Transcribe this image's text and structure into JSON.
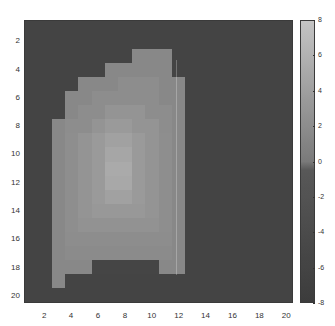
{
  "chart_data": {
    "type": "heatmap",
    "title": "",
    "xlabel": "",
    "ylabel": "",
    "x_ticks": [
      2,
      4,
      6,
      8,
      10,
      12,
      14,
      16,
      18,
      20
    ],
    "y_ticks": [
      2,
      4,
      6,
      8,
      10,
      12,
      14,
      16,
      18,
      20
    ],
    "n_rows": 20,
    "n_cols": 20,
    "colorbar": {
      "ticks": [
        8,
        6,
        4,
        2,
        0,
        -2,
        -4,
        -6,
        -8
      ],
      "vmin": -8,
      "vmax": 8,
      "colormap": "gray"
    },
    "values": [
      [
        -6,
        -6,
        -6,
        -6,
        -6,
        -6,
        -6,
        -6,
        -6,
        -6,
        -6,
        -6,
        -6,
        -6,
        -6,
        -6,
        -6,
        -6,
        -6,
        -6
      ],
      [
        -6,
        -6,
        -6,
        -6,
        -6,
        -6,
        -6,
        -6,
        -6,
        -6,
        -6,
        -6,
        -6,
        -6,
        -6,
        -6,
        -6,
        -6,
        -6,
        -6
      ],
      [
        -6,
        -6,
        -6,
        -6,
        -6,
        -6,
        -6,
        -6,
        1.5,
        1.5,
        1.5,
        -6,
        -6,
        -6,
        -6,
        -6,
        -6,
        -6,
        -6,
        -6
      ],
      [
        -6,
        -6,
        -6,
        -6,
        -6,
        -6,
        1.5,
        1.5,
        1.5,
        1.5,
        1.5,
        -6,
        -6,
        -6,
        -6,
        -6,
        -6,
        -6,
        -6,
        -6
      ],
      [
        -6,
        -6,
        -6,
        -6,
        1.5,
        1.5,
        1.5,
        2,
        2,
        2,
        1.5,
        1.5,
        -6,
        -6,
        -6,
        -6,
        -6,
        -6,
        -6,
        -6
      ],
      [
        -6,
        -6,
        -6,
        1.5,
        1.5,
        2,
        2,
        2,
        2,
        2,
        1.5,
        1.5,
        -6,
        -6,
        -6,
        -6,
        -6,
        -6,
        -6,
        -6
      ],
      [
        -6,
        -6,
        -6,
        1.5,
        2,
        2,
        2.8,
        2.8,
        2.8,
        2,
        2,
        1.5,
        -6,
        -6,
        -6,
        -6,
        -6,
        -6,
        -6,
        -6
      ],
      [
        -6,
        -6,
        1.5,
        2,
        2,
        2.8,
        3.5,
        3.5,
        2.8,
        2.8,
        2,
        1.5,
        -6,
        -6,
        -6,
        -6,
        -6,
        -6,
        -6,
        -6
      ],
      [
        -6,
        -6,
        1.5,
        2.2,
        2.8,
        3.5,
        4.2,
        4.2,
        3.5,
        2.8,
        2.2,
        1.5,
        -6,
        -6,
        -6,
        -6,
        -6,
        -6,
        -6,
        -6
      ],
      [
        -6,
        -6,
        1.5,
        2.2,
        2.8,
        3.5,
        4.8,
        4.8,
        3.5,
        2.8,
        2.2,
        1.5,
        -6,
        -6,
        -6,
        -6,
        -6,
        -6,
        -6,
        -6
      ],
      [
        -6,
        -6,
        1.5,
        2.2,
        2.8,
        3.5,
        5.2,
        5.2,
        3.5,
        2.8,
        2.2,
        1.5,
        -6,
        -6,
        -6,
        -6,
        -6,
        -6,
        -6,
        -6
      ],
      [
        -6,
        -6,
        1.5,
        2.2,
        2.8,
        3.5,
        5,
        5,
        3.5,
        2.8,
        2.2,
        1.5,
        -6,
        -6,
        -6,
        -6,
        -6,
        -6,
        -6,
        -6
      ],
      [
        -6,
        -6,
        1.5,
        2.2,
        2.8,
        3.5,
        4.2,
        4.2,
        3.5,
        2.8,
        2.2,
        1.5,
        -6,
        -6,
        -6,
        -6,
        -6,
        -6,
        -6,
        -6
      ],
      [
        -6,
        -6,
        1.5,
        2.2,
        2.8,
        3.2,
        3.2,
        3.2,
        3.2,
        2.8,
        2.2,
        1.5,
        -6,
        -6,
        -6,
        -6,
        -6,
        -6,
        -6,
        -6
      ],
      [
        -6,
        -6,
        1.5,
        2.2,
        2.6,
        2.6,
        2.6,
        2.6,
        2.6,
        2.6,
        2.2,
        1.5,
        -6,
        -6,
        -6,
        -6,
        -6,
        -6,
        -6,
        -6
      ],
      [
        -6,
        -6,
        1.5,
        2,
        2,
        2,
        2,
        2,
        2,
        2,
        2,
        1.5,
        -6,
        -6,
        -6,
        -6,
        -6,
        -6,
        -6,
        -6
      ],
      [
        -6,
        -6,
        1.5,
        1.8,
        1.8,
        1.8,
        1.8,
        1.8,
        1.8,
        1.8,
        1.8,
        1.5,
        -6,
        -6,
        -6,
        -6,
        -6,
        -6,
        -6,
        -6
      ],
      [
        -6,
        -6,
        1.5,
        1.5,
        1.5,
        -5.5,
        -5.5,
        -5.5,
        -5.5,
        -5.5,
        1.5,
        1.5,
        -6,
        -6,
        -6,
        -6,
        -6,
        -6,
        -6,
        -6
      ],
      [
        -6,
        -6,
        1.5,
        -6,
        -6,
        -6,
        -6,
        -6,
        -6,
        -6,
        -6,
        -6,
        -6,
        -6,
        -6,
        -6,
        -6,
        -6,
        -6,
        -6
      ],
      [
        -6,
        -6,
        -6,
        -6,
        -6,
        -6,
        -6,
        -6,
        -6,
        -6,
        -6,
        -6,
        -6,
        -6,
        -6,
        -6,
        -6,
        -6,
        -6,
        -6
      ]
    ],
    "grid": false,
    "legend": "colorbar-right"
  }
}
